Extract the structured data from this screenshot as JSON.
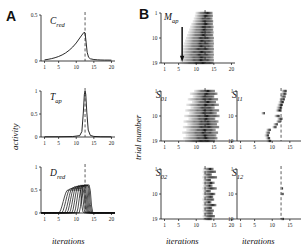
{
  "figure": {
    "panels": [
      {
        "id": "A",
        "letter": "A"
      },
      {
        "id": "B",
        "letter": "B"
      }
    ],
    "axis_labels": {
      "x": "iterations",
      "y_left": "activity",
      "y_right": "trial number"
    }
  },
  "chart_data": [
    {
      "id": "A1",
      "type": "line",
      "title": "C",
      "subscript": "red",
      "xlabel": "",
      "ylabel": "activity",
      "xlim": [
        0,
        21
      ],
      "ylim": [
        0,
        0.5
      ],
      "xticks": [
        1,
        5,
        10,
        15,
        20
      ],
      "yticks": [
        0,
        0.5
      ],
      "ytick_labels": [
        "0",
        "0.5"
      ],
      "grid": false,
      "vline": 12.5,
      "x": [
        1,
        2,
        3,
        4,
        5,
        6,
        7,
        8,
        9,
        10,
        11,
        11.6,
        12.2,
        12.5,
        12.8,
        13.1,
        13.5,
        14,
        15,
        16,
        17,
        18,
        19,
        20
      ],
      "y": [
        0.012,
        0.018,
        0.026,
        0.036,
        0.049,
        0.066,
        0.088,
        0.117,
        0.152,
        0.196,
        0.25,
        0.282,
        0.312,
        0.305,
        0.205,
        0.095,
        0.04,
        0.024,
        0.016,
        0.013,
        0.011,
        0.01,
        0.01,
        0.009
      ]
    },
    {
      "id": "A2",
      "type": "line",
      "title": "T",
      "subscript": "ap",
      "xlabel": "",
      "ylabel": "activity",
      "xlim": [
        0,
        21
      ],
      "ylim": [
        0,
        1
      ],
      "xticks": [
        1,
        5,
        10,
        15,
        20
      ],
      "yticks": [
        0,
        0.5,
        1
      ],
      "ytick_labels": [
        "0",
        "0.5",
        "1"
      ],
      "grid": false,
      "vline": 12.5,
      "x": [
        1,
        5,
        9,
        11,
        11.6,
        12.0,
        12.3,
        12.5,
        12.7,
        13.0,
        13.4,
        14,
        15,
        17,
        20
      ],
      "y": [
        0.005,
        0.006,
        0.01,
        0.03,
        0.12,
        0.52,
        0.92,
        1.0,
        0.93,
        0.54,
        0.15,
        0.035,
        0.012,
        0.006,
        0.005
      ]
    },
    {
      "id": "A3",
      "type": "line",
      "title": "D",
      "subscript": "red",
      "xlabel": "iterations",
      "ylabel": "activity",
      "xlim": [
        0,
        21
      ],
      "ylim": [
        0,
        1
      ],
      "xticks": [
        1,
        5,
        10,
        15,
        20
      ],
      "yticks": [
        0,
        0.5,
        1
      ],
      "ytick_labels": [
        "0",
        "0.5",
        "1"
      ],
      "grid": false,
      "vline": 12.5,
      "n_traces": 9,
      "series": [
        {
          "name": "trace-1",
          "onset": 5.0,
          "peak": 0.5,
          "offset": 11.2
        },
        {
          "name": "trace-2",
          "onset": 5.8,
          "peak": 0.53,
          "offset": 11.7
        },
        {
          "name": "trace-3",
          "onset": 6.6,
          "peak": 0.55,
          "offset": 12.1
        },
        {
          "name": "trace-4",
          "onset": 7.3,
          "peak": 0.57,
          "offset": 12.4
        },
        {
          "name": "trace-5",
          "onset": 8.0,
          "peak": 0.58,
          "offset": 12.7
        },
        {
          "name": "trace-6",
          "onset": 8.7,
          "peak": 0.59,
          "offset": 13.0
        },
        {
          "name": "trace-7",
          "onset": 9.4,
          "peak": 0.6,
          "offset": 13.3
        },
        {
          "name": "trace-8",
          "onset": 10.1,
          "peak": 0.6,
          "offset": 13.6
        },
        {
          "name": "trace-9",
          "onset": 10.8,
          "peak": 0.61,
          "offset": 13.9
        }
      ]
    },
    {
      "id": "B1",
      "type": "scatter",
      "title": "M",
      "subscript": "ap",
      "xlabel": "",
      "ylabel": "trial number",
      "xlim": [
        0,
        21
      ],
      "ylim": [
        1,
        19
      ],
      "xticks": [
        1,
        5,
        10,
        15,
        20
      ],
      "yticks": [
        1,
        10,
        19
      ],
      "ytick_labels": [
        "1",
        "10",
        "19"
      ],
      "grid": false,
      "vline": 12.5,
      "annotation": "arrow-down",
      "raster": [
        {
          "trial": 1,
          "start": 9.8,
          "end": 14.6
        },
        {
          "trial": 2,
          "start": 9.6,
          "end": 14.7
        },
        {
          "trial": 3,
          "start": 9.3,
          "end": 14.6
        },
        {
          "trial": 4,
          "start": 9.0,
          "end": 14.8
        },
        {
          "trial": 5,
          "start": 8.6,
          "end": 14.7
        },
        {
          "trial": 6,
          "start": 8.3,
          "end": 14.9
        },
        {
          "trial": 7,
          "start": 8.0,
          "end": 14.8
        },
        {
          "trial": 8,
          "start": 7.7,
          "end": 14.9
        },
        {
          "trial": 9,
          "start": 7.4,
          "end": 14.8
        },
        {
          "trial": 10,
          "start": 7.1,
          "end": 15.0
        },
        {
          "trial": 11,
          "start": 6.8,
          "end": 14.9
        },
        {
          "trial": 12,
          "start": 6.5,
          "end": 15.0
        },
        {
          "trial": 13,
          "start": 6.2,
          "end": 14.9
        },
        {
          "trial": 14,
          "start": 6.0,
          "end": 15.0
        },
        {
          "trial": 15,
          "start": 5.8,
          "end": 14.9
        },
        {
          "trial": 16,
          "start": 5.6,
          "end": 15.0
        },
        {
          "trial": 17,
          "start": 5.5,
          "end": 14.9
        },
        {
          "trial": 18,
          "start": 5.4,
          "end": 15.0
        },
        {
          "trial": 19,
          "start": 5.3,
          "end": 14.9
        }
      ]
    },
    {
      "id": "B2",
      "type": "scatter",
      "title": "S",
      "subscript": "01",
      "xlabel": "",
      "ylabel": "trial number",
      "xlim": [
        0,
        21
      ],
      "ylim": [
        1,
        19
      ],
      "xticks": [
        1,
        5,
        10,
        15,
        20
      ],
      "yticks": [
        1,
        10,
        19
      ],
      "ytick_labels": [
        "1",
        "10",
        "19"
      ],
      "grid": false,
      "vline": 12.5,
      "raster": [
        {
          "trial": 1,
          "start": 9.4,
          "end": 15.3
        },
        {
          "trial": 2,
          "start": 8.2,
          "end": 16.0
        },
        {
          "trial": 3,
          "start": 9.0,
          "end": 15.1
        },
        {
          "trial": 4,
          "start": 7.6,
          "end": 16.2
        },
        {
          "trial": 5,
          "start": 8.8,
          "end": 15.6
        },
        {
          "trial": 6,
          "start": 7.2,
          "end": 16.4
        },
        {
          "trial": 7,
          "start": 8.4,
          "end": 15.2
        },
        {
          "trial": 8,
          "start": 6.9,
          "end": 16.5
        },
        {
          "trial": 9,
          "start": 8.0,
          "end": 15.8
        },
        {
          "trial": 10,
          "start": 6.6,
          "end": 16.6
        },
        {
          "trial": 11,
          "start": 7.8,
          "end": 15.4
        },
        {
          "trial": 12,
          "start": 6.4,
          "end": 16.3
        },
        {
          "trial": 13,
          "start": 7.5,
          "end": 15.9
        },
        {
          "trial": 14,
          "start": 6.2,
          "end": 16.5
        },
        {
          "trial": 15,
          "start": 7.2,
          "end": 15.5
        },
        {
          "trial": 16,
          "start": 6.0,
          "end": 16.2
        },
        {
          "trial": 17,
          "start": 7.0,
          "end": 15.7
        },
        {
          "trial": 18,
          "start": 6.3,
          "end": 16.0
        },
        {
          "trial": 19,
          "start": 6.8,
          "end": 15.3
        }
      ]
    },
    {
      "id": "B3",
      "type": "scatter",
      "title": "S",
      "subscript": "11",
      "xlabel": "",
      "ylabel": "",
      "xlim": [
        0,
        21
      ],
      "ylim": [
        1,
        19
      ],
      "xticks": [
        1,
        5,
        10,
        15,
        20
      ],
      "yticks": [
        1,
        10,
        19
      ],
      "ytick_labels": [
        "1",
        "10",
        "19"
      ],
      "grid": false,
      "vline": 12.5,
      "raster": [
        {
          "trial": 1,
          "start": 12.6,
          "end": 14.1
        },
        {
          "trial": 2,
          "start": 12.5,
          "end": 14.0
        },
        {
          "trial": 3,
          "start": 12.2,
          "end": 13.8
        },
        {
          "trial": 4,
          "start": 12.0,
          "end": 13.6
        },
        {
          "trial": 5,
          "start": 11.8,
          "end": 13.3
        },
        {
          "trial": 6,
          "start": 11.5,
          "end": 13.0
        },
        {
          "trial": 7,
          "start": 11.2,
          "end": 12.8
        },
        {
          "trial": 8,
          "start": 11.0,
          "end": 12.5
        },
        {
          "trial": 9,
          "start": 6.9,
          "end": 7.9
        },
        {
          "trial": 10,
          "start": 10.6,
          "end": 12.1
        },
        {
          "trial": 11,
          "start": 11.4,
          "end": 12.9
        },
        {
          "trial": 12,
          "start": 11.1,
          "end": 12.4
        },
        {
          "trial": 13,
          "start": 10.3,
          "end": 11.6
        },
        {
          "trial": 14,
          "start": 10.0,
          "end": 11.2
        },
        {
          "trial": 15,
          "start": 8.3,
          "end": 9.6
        },
        {
          "trial": 16,
          "start": 8.0,
          "end": 9.3
        },
        {
          "trial": 17,
          "start": 7.8,
          "end": 9.1
        },
        {
          "trial": 18,
          "start": 8.1,
          "end": 9.4
        },
        {
          "trial": 19,
          "start": 8.4,
          "end": 9.7
        }
      ]
    },
    {
      "id": "B4",
      "type": "scatter",
      "title": "S",
      "subscript": "02",
      "xlabel": "iterations",
      "ylabel": "trial number",
      "xlim": [
        0,
        21
      ],
      "ylim": [
        1,
        19
      ],
      "xticks": [
        1,
        5,
        10,
        15,
        20
      ],
      "yticks": [
        1,
        10,
        19
      ],
      "ytick_labels": [
        "1",
        "10",
        "19"
      ],
      "grid": false,
      "vline": 12.5,
      "raster": [
        {
          "trial": 1,
          "start": 11.9,
          "end": 14.9
        },
        {
          "trial": 2,
          "start": 11.8,
          "end": 15.6
        },
        {
          "trial": 3,
          "start": 11.9,
          "end": 14.4
        },
        {
          "trial": 4,
          "start": 11.7,
          "end": 15.9
        },
        {
          "trial": 5,
          "start": 11.9,
          "end": 14.2
        },
        {
          "trial": 6,
          "start": 11.8,
          "end": 15.2
        },
        {
          "trial": 7,
          "start": 11.9,
          "end": 14.6
        },
        {
          "trial": 8,
          "start": 11.7,
          "end": 15.8
        },
        {
          "trial": 9,
          "start": 11.9,
          "end": 14.1
        },
        {
          "trial": 10,
          "start": 11.8,
          "end": 15.4
        },
        {
          "trial": 11,
          "start": 11.9,
          "end": 14.8
        },
        {
          "trial": 12,
          "start": 11.7,
          "end": 15.1
        },
        {
          "trial": 13,
          "start": 11.9,
          "end": 14.3
        },
        {
          "trial": 14,
          "start": 11.8,
          "end": 15.7
        },
        {
          "trial": 15,
          "start": 11.9,
          "end": 14.5
        },
        {
          "trial": 16,
          "start": 11.8,
          "end": 15.0
        },
        {
          "trial": 17,
          "start": 11.9,
          "end": 14.7
        },
        {
          "trial": 18,
          "start": 11.8,
          "end": 15.3
        },
        {
          "trial": 19,
          "start": 11.9,
          "end": 14.4
        }
      ]
    },
    {
      "id": "B5",
      "type": "scatter",
      "title": "S",
      "subscript": "12",
      "xlabel": "iterations",
      "ylabel": "",
      "xlim": [
        0,
        21
      ],
      "ylim": [
        1,
        19
      ],
      "xticks": [
        1,
        5,
        10,
        15,
        20
      ],
      "yticks": [
        1,
        10,
        19
      ],
      "ytick_labels": [
        "1",
        "10",
        "19"
      ],
      "grid": false,
      "vline": 12.5,
      "raster": [
        {
          "trial": 8,
          "start": 12.4,
          "end": 13.1
        },
        {
          "trial": 10,
          "start": 12.3,
          "end": 13.2
        },
        {
          "trial": 19,
          "start": 12.3,
          "end": 13.3
        }
      ]
    }
  ]
}
